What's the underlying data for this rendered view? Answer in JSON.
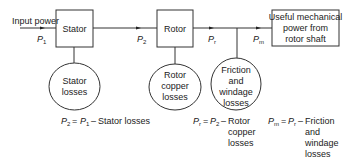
{
  "diagram": {
    "input_label": "Input power",
    "blocks": {
      "stator": "Stator",
      "rotor": "Rotor",
      "output": [
        "Useful mechanical",
        "power from",
        "rotor shaft"
      ]
    },
    "signals": {
      "p1": {
        "sym": "P",
        "sub": "1"
      },
      "p2": {
        "sym": "P",
        "sub": "2"
      },
      "pr": {
        "sym": "P",
        "sub": "r"
      },
      "pm": {
        "sym": "P",
        "sub": "m"
      }
    },
    "losses": {
      "stator": [
        "Stator",
        "losses"
      ],
      "rotor_copper": [
        "Rotor",
        "copper",
        "losses"
      ],
      "friction": [
        "Friction",
        "and",
        "windage",
        "losses"
      ]
    },
    "equations": {
      "eq1": {
        "lhs_sub": "2",
        "rhs_sub": "1",
        "text": "Stator losses"
      },
      "eq2": {
        "lhs_sub": "r",
        "rhs_sub": "2",
        "text": [
          "Rotor",
          "copper",
          "losses"
        ]
      },
      "eq3": {
        "lhs_sub": "m",
        "rhs_sub": "r",
        "text": [
          "Friction",
          "and",
          "windage",
          "losses"
        ]
      }
    },
    "line_color": "#333333"
  }
}
